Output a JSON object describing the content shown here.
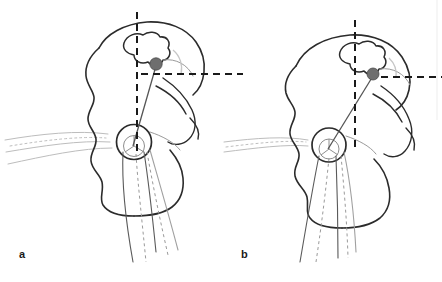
{
  "figure": {
    "kind": "medical-line-drawing",
    "background_color": "#ffffff",
    "width": 442,
    "height": 282,
    "border_color": "#e8e8e8"
  },
  "panels": [
    {
      "id": "a",
      "label": "a",
      "label_x": 19,
      "label_y": 249,
      "description": "Pelvis hemi-outline with vertical and horizontal dashed reference lines, gray landmark marker and measurement line to femoral head center"
    },
    {
      "id": "b",
      "label": "b",
      "label_x": 241,
      "label_y": 249,
      "description": "Rotated pelvis hemi-outline with vertical and horizontal dashed reference lines, gray landmark marker and measurement line to femoral head center"
    }
  ],
  "strokes": {
    "bone_outline": "#2b2b2b",
    "bone_outline_width": 1.6,
    "faint_outline": "#b9b9b9",
    "faint_outline_width": 1.0,
    "mid_outline": "#7d7d7d",
    "mid_outline_width": 1.0,
    "dashed_line": "#1a1a1a",
    "dashed_line_width": 2.0,
    "dash_pattern": "7 5",
    "arc_color": "#c2c2c2",
    "arc_width": 1.2,
    "marker_fill": "#6e6e6e",
    "marker_stroke": "#4a4a4a",
    "measurement_line": "#555555",
    "measurement_line_width": 1.2
  },
  "markers": [
    {
      "panel": "a",
      "name": "landmark-dot",
      "cx": 156,
      "cy": 64,
      "r": 6.2
    },
    {
      "panel": "b",
      "name": "landmark-dot",
      "cx": 373,
      "cy": 74,
      "r": 6.0
    }
  ],
  "reference_lines": {
    "a": {
      "vertical_x": 137,
      "vertical_y1": 12,
      "vertical_y2": 152,
      "horizontal_y": 74,
      "horizontal_x1": 141,
      "horizontal_x2": 243
    },
    "b": {
      "vertical_x": 355,
      "vertical_y1": 20,
      "vertical_y2": 150,
      "horizontal_y": 77,
      "horizontal_x1": 369,
      "horizontal_x2": 442
    }
  },
  "femoral_head": {
    "a": {
      "cx": 134,
      "cy": 142,
      "r": 17.5
    },
    "b": {
      "cx": 329,
      "cy": 145,
      "r": 17.0
    }
  }
}
